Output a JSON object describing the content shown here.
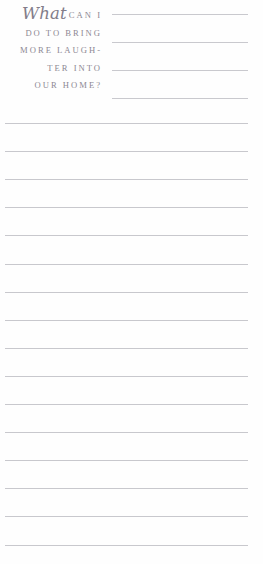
{
  "page": {
    "type": "journal-prompt-page",
    "background_color": "#fefefe",
    "width": 263,
    "height": 564
  },
  "prompt": {
    "script_word": "What",
    "lines": [
      "CAN I",
      "DO TO BRING",
      "MORE LAUGH-",
      "TER INTO",
      "OUR HOME?"
    ],
    "full_text": "What can I do to bring more laughter into our home?",
    "text_color": "#8a8590",
    "script_color": "#827d8a"
  },
  "header_rules": {
    "count": 4,
    "color": "#c9c9ce",
    "left": 112,
    "width": 136,
    "tops": [
      14,
      42,
      70,
      98
    ]
  },
  "writing_rules": {
    "count": 16,
    "color": "#c8c8cd",
    "left": 5,
    "width": 243,
    "first_top": 123,
    "spacing": 28.1
  }
}
